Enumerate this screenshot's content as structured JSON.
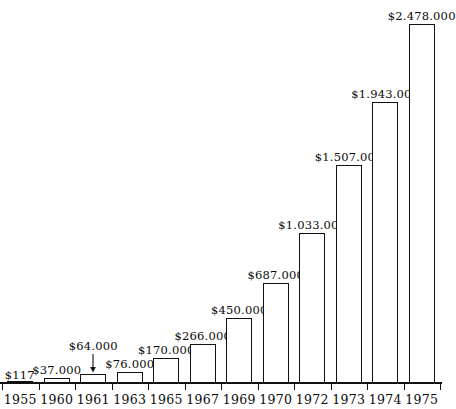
{
  "chart_data": {
    "type": "bar",
    "title": "",
    "subtitle": "",
    "xlabel": "",
    "ylabel": "",
    "grid": false,
    "legend": null,
    "axis": {
      "x_ticks_shown": true,
      "y_axis_shown": false,
      "ylim": [
        0,
        2478000
      ]
    },
    "categories": [
      "1955",
      "1960",
      "1961",
      "1963",
      "1965",
      "1967",
      "1969",
      "1970",
      "1972",
      "1973",
      "1974",
      "1975"
    ],
    "values": [
      117,
      37000,
      64000,
      76000,
      170000,
      266000,
      450000,
      687000,
      1033000,
      1507000,
      1943000,
      2478000
    ],
    "data_labels": [
      "$117",
      "$37.000",
      "$64.000",
      "$76.000",
      "$170.000",
      "$266.000",
      "$450.000",
      "$687.000",
      "$1.033.000",
      "$1.507.000",
      "$1.943.000",
      "$2.478.000"
    ],
    "annotations": [
      {
        "category": "1961",
        "type": "leader-arrow",
        "note": "downward arrow connecting the $64.000 label to its short bar"
      }
    ],
    "style": {
      "bar_fill": "#ffffff",
      "bar_stroke": "#111111",
      "text_color": "#0a0a0a",
      "background": "#ffffff"
    }
  }
}
